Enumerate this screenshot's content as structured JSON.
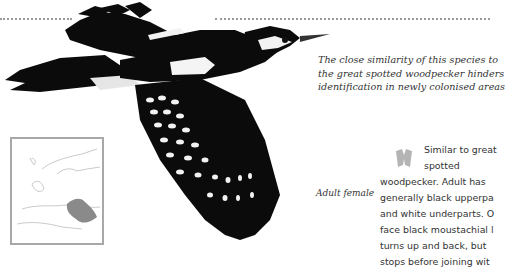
{
  "decor": {
    "divider": "dotted-rule"
  },
  "illustration": {
    "subject": "woodpecker-in-flight",
    "label": "Adult female"
  },
  "caption": {
    "lines": [
      "The close similarity of this species to",
      "the great spotted woodpecker hinders",
      "identification in newly colonised areas"
    ]
  },
  "range_map": {
    "region": "Europe",
    "highlight_color": "#8a8a8a"
  },
  "description": {
    "icon": "binoculars-icon",
    "lines": [
      "Similar to great",
      "spotted",
      "woodpecker. Adult has",
      "generally black upperpa",
      "and white underparts. O",
      "face black moustachial l",
      "turns up and back, but",
      "stops before joining wit"
    ]
  }
}
